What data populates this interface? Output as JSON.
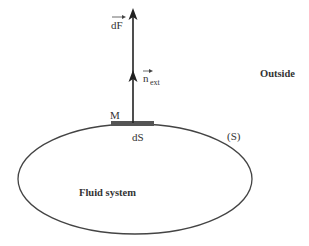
{
  "diagram": {
    "labels": {
      "force": "dF",
      "normal_base": "n",
      "normal_sub": "ext",
      "point": "M",
      "surface_element": "dS",
      "surface": "(S)",
      "outside": "Outside",
      "fluid_system": "Fluid system"
    },
    "colors": {
      "line": "#333333",
      "surface_element": "#555555",
      "text": "#333333",
      "background": "#ffffff"
    }
  }
}
